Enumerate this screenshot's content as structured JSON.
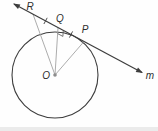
{
  "figure": {
    "kind": "geometry-diagram",
    "labels": {
      "point_R": "R",
      "point_Q": "Q",
      "point_P": "P",
      "center_O": "O",
      "line_m": "m"
    },
    "marks": {
      "right_angle_at": "Q",
      "congruent_segments": [
        "RQ",
        "QP"
      ]
    },
    "colors": {
      "stroke_primary": "#3d3d3d",
      "stroke_secondary": "#a3a3a3",
      "center_dot": "#8d8d8d",
      "background": "#fefefe"
    }
  }
}
